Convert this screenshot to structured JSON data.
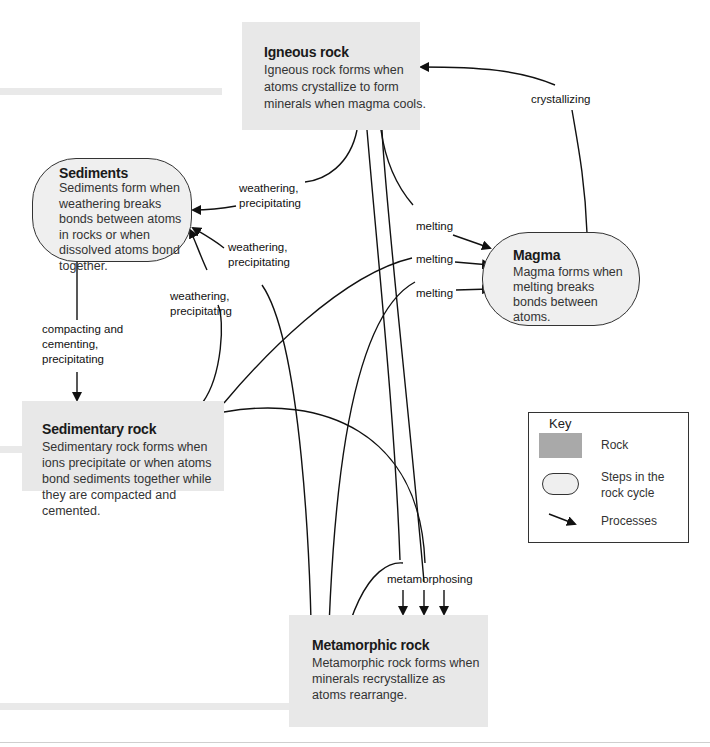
{
  "nodes": {
    "igneous": {
      "type": "rock",
      "title": "Igneous rock",
      "description": "Igneous rock forms when atoms crystallize to form minerals when magma cools."
    },
    "sediments": {
      "type": "step",
      "title": "Sediments",
      "description": "Sediments form when weathering breaks bonds between atoms in rocks or when dissolved atoms bond together."
    },
    "magma": {
      "type": "step",
      "title": "Magma",
      "description": "Magma forms when melting breaks bonds between atoms."
    },
    "sedimentary": {
      "type": "rock",
      "title": "Sedimentary rock",
      "description": "Sedimentary rock forms when ions precipitate or when atoms bond sediments together while they are compacted and cemented."
    },
    "metamorphic": {
      "type": "rock",
      "title": "Metamorphic rock",
      "description": "Metamorphic rock forms when minerals recrystallize as atoms rearrange."
    }
  },
  "processes": {
    "crystallizing": "crystallizing",
    "weathering_1": "weathering, precipitating",
    "weathering_2": "weathering, precipitating",
    "weathering_3": "weathering, precipitating",
    "melting_1": "melting",
    "melting_2": "melting",
    "melting_3": "melting",
    "compacting": "compacting and cementing, precipitating",
    "metamorphosing": "metamorphosing"
  },
  "key": {
    "title": "Key",
    "items": [
      {
        "icon": "gray-rectangle",
        "label": "Rock"
      },
      {
        "icon": "rounded-oval",
        "label": "Steps in the rock cycle"
      },
      {
        "icon": "arrow",
        "label": "Processes"
      }
    ]
  },
  "colors": {
    "rock_fill": "#e8e8e8",
    "step_fill": "#efefef",
    "key_rock_swatch": "#a9a9a9",
    "line": "#111111"
  }
}
